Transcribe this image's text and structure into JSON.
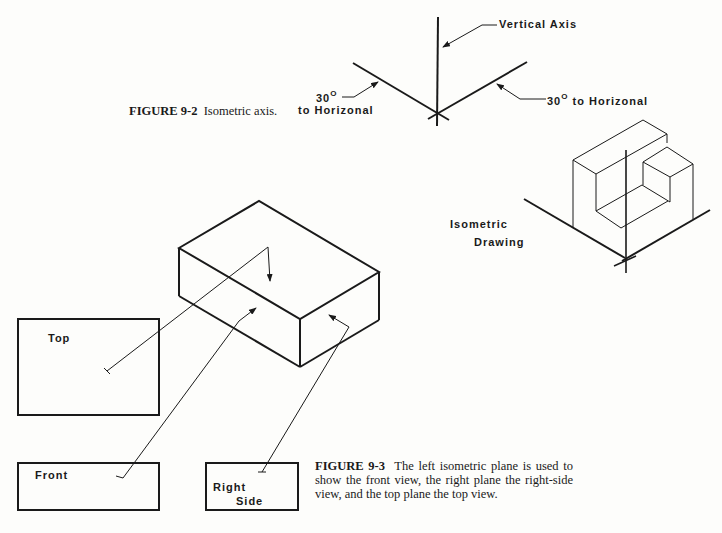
{
  "figure_9_2": {
    "caption_number": "FIGURE 9-2",
    "caption_text": "Isometric axis.",
    "labels": {
      "vertical_axis": "Vertical Axis",
      "left_angle_value": "30",
      "left_angle_unit": "O",
      "left_angle_suffix": "to Horizonal",
      "right_angle_value": "30",
      "right_angle_unit": "O",
      "right_angle_suffix": "to Horizonal"
    }
  },
  "isometric_drawing": {
    "label_line1": "Isometric",
    "label_line2": "Drawing"
  },
  "figure_9_3": {
    "caption_number": "FIGURE 9-3",
    "caption_text": "The left isometric plane is used to show the front view, the right plane the right-side view, and the top plane the top view.",
    "views": {
      "top": "Top",
      "front": "Front",
      "right_line1": "Right",
      "right_line2": "Side"
    }
  },
  "colors": {
    "ink": "#1a1a1a",
    "paper": "#fdfdfb"
  }
}
